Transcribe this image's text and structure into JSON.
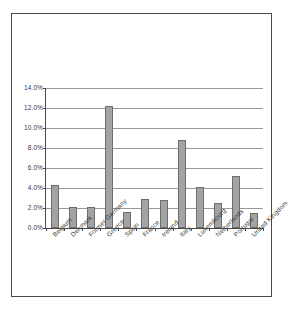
{
  "chart_data": {
    "type": "bar",
    "title": "",
    "xlabel": "",
    "ylabel": "",
    "categories": [
      "Belgium",
      "Denmark",
      "Former Germany",
      "Greece",
      "Spain",
      "France",
      "Ireland",
      "Italy",
      "Luxembourg",
      "Netherlands",
      "Portugal",
      "United Kingdom"
    ],
    "values": [
      4.3,
      2.1,
      2.1,
      12.2,
      1.65,
      2.9,
      2.85,
      8.8,
      4.1,
      2.5,
      5.2,
      1.5
    ],
    "value_unit": "%",
    "ylim": [
      0,
      14
    ],
    "ytick_values": [
      0,
      2,
      4,
      6,
      8,
      10,
      12,
      14
    ],
    "ytick_labels": [
      "0.0%",
      "2.0%",
      "4.0%",
      "6.0%",
      "8.0%",
      "10.0%",
      "12.0%",
      "14.0%"
    ],
    "grid": true,
    "legend": false,
    "legend_position": "none",
    "bar_color": "#a3a3a3",
    "bar_edge_color": "#6d6d6d",
    "gridline_color": "#9a9a9a",
    "axis_color": "#4a4a4a",
    "frame_color": "#4a4a4a",
    "background_color": "#ffffff",
    "xtick_label_rotation": -45
  }
}
